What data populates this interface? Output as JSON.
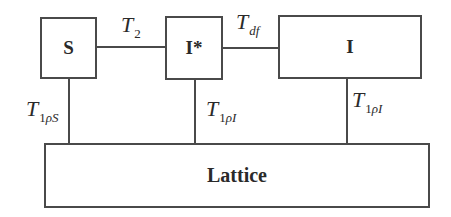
{
  "diagram": {
    "nodes": {
      "S": {
        "label": "S"
      },
      "I_star": {
        "label": "I*"
      },
      "I": {
        "label": "I"
      },
      "lattice": {
        "label": "Lattice"
      }
    },
    "edges": {
      "S_to_I_star": {
        "symbol": "T",
        "subscript": "2"
      },
      "I_star_to_I": {
        "symbol": "T",
        "subscript": "df"
      },
      "S_to_lattice": {
        "symbol": "T",
        "subscript_num": "1",
        "subscript_rest": "ρS"
      },
      "I_star_to_lattice": {
        "symbol": "T",
        "subscript_num": "1",
        "subscript_rest": "ρI"
      },
      "I_to_lattice": {
        "symbol": "T",
        "subscript_num": "1",
        "subscript_rest": "ρI"
      }
    },
    "colors": {
      "stroke": "#4a4a4a",
      "text": "#2a2a2a",
      "background": "#ffffff"
    }
  }
}
